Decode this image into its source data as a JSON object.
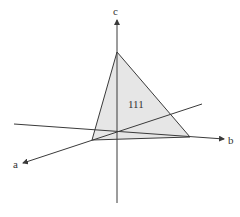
{
  "diagram": {
    "title": "",
    "plane_label": "111",
    "axes": {
      "a": {
        "label": "a"
      },
      "b": {
        "label": "b"
      },
      "c": {
        "label": "c"
      }
    },
    "colors": {
      "line": "#3a3a3a",
      "plane_fill": "#e6e6e6",
      "background": "#ffffff"
    }
  }
}
